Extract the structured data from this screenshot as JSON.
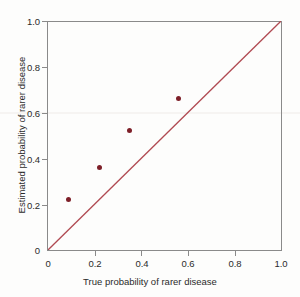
{
  "chart_data": {
    "type": "scatter",
    "title": "",
    "xlabel": "True probability of rarer disease",
    "ylabel": "Estimated probability of rarer disease",
    "xlim": [
      0,
      1.0
    ],
    "ylim": [
      0,
      1.0
    ],
    "grid": false,
    "legend": "none",
    "xticks": [
      "0",
      "0.2",
      "0.4",
      "0.6",
      "0.8",
      "1.0"
    ],
    "xtick_values": [
      0,
      0.2,
      0.4,
      0.6,
      0.8,
      1.0
    ],
    "yticks": [
      "0",
      "0.2",
      "0.4",
      "0.6",
      "0.8",
      "1.0"
    ],
    "ytick_values": [
      0,
      0.2,
      0.4,
      0.6,
      0.8,
      1.0
    ],
    "series": [
      {
        "name": "Estimates",
        "marker": "filled-circle",
        "color": "#7d1f28",
        "points": [
          {
            "x": 0.09,
            "y": 0.22
          },
          {
            "x": 0.22,
            "y": 0.36
          },
          {
            "x": 0.35,
            "y": 0.52
          },
          {
            "x": 0.56,
            "y": 0.66
          }
        ]
      }
    ],
    "reference_line": {
      "name": "Identity line (y = x)",
      "color": "#b04a52",
      "from": {
        "x": 0.0,
        "y": 0.0
      },
      "to": {
        "x": 1.0,
        "y": 1.0
      }
    },
    "colors": {
      "axis": "#8a8a8a",
      "text": "#2b2b2b",
      "marker": "#7d1f28",
      "reference_line": "#b04a52",
      "background": "#fdfdfc"
    }
  }
}
